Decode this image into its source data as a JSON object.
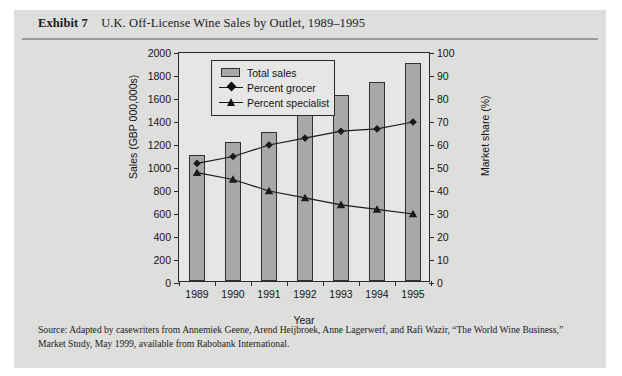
{
  "exhibit": {
    "label": "Exhibit",
    "number": "7",
    "title": "U.K. Off-License Wine Sales by Outlet, 1989–1995"
  },
  "source_note": "Source: Adapted by casewriters from Annemiek Geene, Arend Heijbroek, Anne Lagerwerf, and Rafi Wazir, “The World Wine Business,” Market Study, May 1999, available from Rabobank International.",
  "colors": {
    "page_background": "#ffffff",
    "panel_background": "#dededd",
    "plot_background": "#e6e6e5",
    "bar_fill": "#a8a8a6",
    "bar_stroke": "#303030",
    "line_color": "#1a1a1a",
    "axis_color": "#2b2b2b",
    "text_color": "#1b1b1b",
    "rule_color": "#9a9a98"
  },
  "chart_data": {
    "type": "bar",
    "title": "U.K. Off-License Wine Sales by Outlet, 1989–1995",
    "categories": [
      "1989",
      "1990",
      "1991",
      "1992",
      "1993",
      "1994",
      "1995"
    ],
    "xlabel": "Year",
    "ylabel": "Sales (GBP 000,000s)",
    "y2label": "Market share (%)",
    "ylim": [
      0,
      2000
    ],
    "y2lim": [
      0,
      100
    ],
    "yticks": [
      0,
      200,
      400,
      600,
      800,
      1000,
      1200,
      1400,
      1600,
      1800,
      2000
    ],
    "y2ticks": [
      0,
      10,
      20,
      30,
      40,
      50,
      60,
      70,
      80,
      90,
      100
    ],
    "grid": false,
    "legend_position": "upper-left-inside",
    "series": [
      {
        "name": "Total sales",
        "kind": "bar",
        "axis": "left",
        "unit": "GBP 000,000s",
        "values": [
          1100,
          1210,
          1300,
          1500,
          1620,
          1730,
          1900
        ]
      },
      {
        "name": "Percent grocer",
        "kind": "line",
        "marker": "diamond",
        "axis": "right",
        "unit": "%",
        "values": [
          52,
          55,
          60,
          63,
          66,
          67,
          70
        ]
      },
      {
        "name": "Percent specialist",
        "kind": "line",
        "marker": "triangle",
        "axis": "right",
        "unit": "%",
        "values": [
          48,
          45,
          40,
          37,
          34,
          32,
          30
        ]
      }
    ]
  }
}
